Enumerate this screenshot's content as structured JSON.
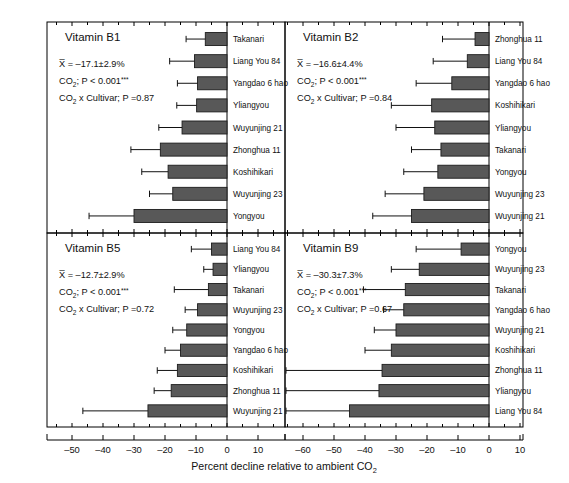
{
  "figure": {
    "xlabel_main": "Percent decline relative to ambient CO",
    "xlabel_sub": "2",
    "bar_color": "#585858",
    "axis_color": "#000000"
  },
  "axis": {
    "ticks": [
      -60,
      -50,
      -40,
      -30,
      -20,
      -10,
      0,
      10
    ],
    "tick_labels": [
      "–60",
      "–50",
      "–40",
      "–30",
      "–20",
      "–10",
      "0",
      "10"
    ],
    "xmin": -68,
    "xmax": 17
  },
  "chart_data": {
    "type": "bar",
    "xlabel": "Percent decline relative to ambient CO2",
    "ylabel": "",
    "xlim": [
      -68,
      17
    ],
    "grid": false,
    "legend": "none",
    "orientation": "horizontal",
    "panels": [
      {
        "id": "b1",
        "title": "Vitamin B1",
        "mean_label": "X̅ = –17.1±2.9%",
        "mean_value": -17.1,
        "mean_se": 2.9,
        "co2_label_pre": "CO",
        "co2_label_sub": "2",
        "co2_label_post": "; P < 0.001",
        "co2_stars": "***",
        "interaction_pre": "CO",
        "interaction_sub": "2",
        "interaction_post": " x Cultivar; P =0.87",
        "interaction_p": 0.87,
        "categories": [
          "Takanari",
          "Liang You 84",
          "Yangdao 6 hao",
          "Yliangyou",
          "Wuyunjing 21",
          "Zhonghua 11",
          "Koshihikari",
          "Wuyunjing 23",
          "Yongyou"
        ],
        "values": [
          -7.0,
          -10.5,
          -9.5,
          -9.8,
          -14.5,
          -21.5,
          -19.0,
          -17.5,
          -30.0
        ],
        "errors": [
          6.2,
          8.0,
          6.5,
          6.4,
          7.5,
          9.5,
          8.5,
          7.5,
          14.5
        ]
      },
      {
        "id": "b2",
        "title": "Vitamin B2",
        "mean_label": "X̅ = –16.6±4.4%",
        "mean_value": -16.6,
        "mean_se": 4.4,
        "co2_label_pre": "CO",
        "co2_label_sub": "2",
        "co2_label_post": "; P < 0.001",
        "co2_stars": "***",
        "interaction_pre": "CO",
        "interaction_sub": "2",
        "interaction_post": " x Cultivar; P =0.84",
        "interaction_p": 0.84,
        "categories": [
          "Zhonghua 11",
          "Liang You 84",
          "Yangdao 6 hao",
          "Koshihikari",
          "Yliangyou",
          "Takanari",
          "Yongyou",
          "Wuyunjing 23",
          "Wuyunjing 21"
        ],
        "values": [
          -4.5,
          -7.0,
          -12.0,
          -18.5,
          -17.5,
          -15.5,
          -16.5,
          -21.0,
          -25.0
        ],
        "errors": [
          10.5,
          11.0,
          11.5,
          13.0,
          12.5,
          9.5,
          11.0,
          12.5,
          12.5
        ]
      },
      {
        "id": "b5",
        "title": "Vitamin B5",
        "mean_label": "X̅ = –12.7±2.9%",
        "mean_value": -12.7,
        "mean_se": 2.9,
        "co2_label_pre": "CO",
        "co2_label_sub": "2",
        "co2_label_post": "; P < 0.001",
        "co2_stars": "***",
        "interaction_pre": "CO",
        "interaction_sub": "2",
        "interaction_post": " x Cultivar; P =0.72",
        "interaction_p": 0.72,
        "categories": [
          "Liang You 84",
          "Yliangyou",
          "Takanari",
          "Wuyunjing 23",
          "Yongyou",
          "Yangdao 6 hao",
          "Koshihikari",
          "Zhonghua 11",
          "Wuyunjing 21"
        ],
        "values": [
          -5.0,
          -4.5,
          -6.0,
          -9.5,
          -13.0,
          -15.0,
          -16.0,
          -18.0,
          -25.5
        ],
        "errors": [
          6.5,
          3.0,
          11.0,
          4.0,
          4.5,
          5.0,
          6.5,
          5.5,
          21.0
        ]
      },
      {
        "id": "b9",
        "title": "Vitamin B9",
        "mean_label": "X̅ = –30.3±7.3%",
        "mean_value": -30.3,
        "mean_se": 7.3,
        "co2_label_pre": "CO",
        "co2_label_sub": "2",
        "co2_label_post": "; P < 0.001",
        "co2_stars": "***",
        "interaction_pre": "CO",
        "interaction_sub": "2",
        "interaction_post": " x Cultivar; P =0.67",
        "interaction_p": 0.67,
        "categories": [
          "Yongyou",
          "Wuyunjing 23",
          "Takanari",
          "Yangdao 6 hao",
          "Wuyunjing 21",
          "Koshihikari",
          "Zhonghua 11",
          "Yliangyou",
          "Liang You 84"
        ],
        "values": [
          -9.0,
          -22.5,
          -27.0,
          -27.5,
          -30.0,
          -31.5,
          -34.5,
          -35.5,
          -45.0
        ],
        "errors": [
          14.5,
          9.0,
          13.5,
          6.5,
          7.0,
          8.5,
          34.0,
          35.5,
          25.0
        ]
      }
    ]
  }
}
